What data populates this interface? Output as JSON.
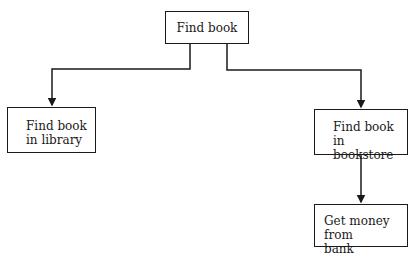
{
  "diagram": {
    "type": "hierarchy-tree",
    "nodes": [
      {
        "id": "root",
        "label": "Find book"
      },
      {
        "id": "lib",
        "label": "Find book\nin library"
      },
      {
        "id": "store",
        "label": "Find book\nin bookstore"
      },
      {
        "id": "bank",
        "label": "Get money from\nbank"
      }
    ],
    "edges": [
      {
        "from": "root",
        "to": "lib"
      },
      {
        "from": "root",
        "to": "store"
      },
      {
        "from": "store",
        "to": "bank"
      }
    ]
  }
}
